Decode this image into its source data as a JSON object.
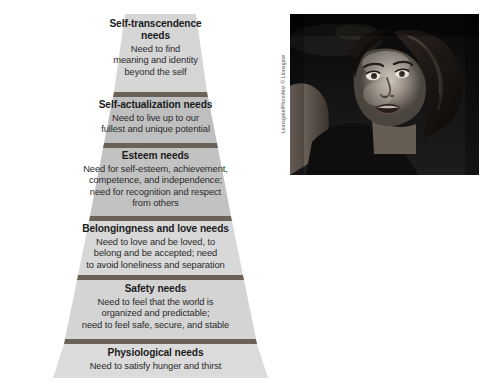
{
  "figure": {
    "kind": "maslow-hierarchy-of-needs-pyramid",
    "colors": {
      "tier_light": "#d6d6d6",
      "tier_dark": "#b9b9b9",
      "divider": "#6b6257",
      "text": "#231f20",
      "background": "#ffffff"
    }
  },
  "pyramid": {
    "tiers": [
      {
        "title": "Self-transcendence needs",
        "description": "Need to find meaning and identity beyond the self",
        "description_lines": [
          "Need to find",
          "meaning and identity",
          "beyond the self"
        ],
        "title_lines": [
          "Self-transcendence",
          "needs"
        ],
        "level": 6,
        "shade": "light"
      },
      {
        "title": "Self-actualization needs",
        "description": "Need to live up to our fullest and unique potential",
        "description_lines": [
          "Need to live up to our",
          "fullest and unique potential"
        ],
        "title_lines": [
          "Self-actualization needs"
        ],
        "level": 5,
        "shade": "dark"
      },
      {
        "title": "Esteem needs",
        "description": "Need for self-esteem, achievement, competence, and independence; need for recognition and respect from others",
        "description_lines": [
          "Need for self-esteem, achievement,",
          "competence, and independence;",
          "need for recognition and respect",
          "from others"
        ],
        "title_lines": [
          "Esteem needs"
        ],
        "level": 4,
        "shade": "dark"
      },
      {
        "title": "Belongingness and love needs",
        "description": "Need to love and be loved, to belong and be accepted; need to avoid loneliness and separation",
        "description_lines": [
          "Need to love and be loved, to",
          "belong and be accepted; need",
          "to avoid loneliness and separation"
        ],
        "title_lines": [
          "Belongingness and love needs"
        ],
        "level": 3,
        "shade": "light"
      },
      {
        "title": "Safety needs",
        "description": "Need to feel that the world is organized and predictable; need to feel safe, secure, and stable",
        "description_lines": [
          "Need to feel that the world is",
          "organized and predictable;",
          "need to feel safe, secure, and stable"
        ],
        "title_lines": [
          "Safety needs"
        ],
        "level": 2,
        "shade": "light"
      },
      {
        "title": "Physiological needs",
        "description": "Need to satisfy hunger and thirst",
        "description_lines": [
          "Need to satisfy hunger and thirst"
        ],
        "title_lines": [
          "Physiological needs"
        ],
        "level": 1,
        "shade": "light"
      }
    ]
  },
  "photo": {
    "credit": "Lionsgate/Photofest © Lionsgate",
    "alt": "Black and white close-up photograph of a young woman with wet hair looking over her shoulder with an intense expression"
  }
}
